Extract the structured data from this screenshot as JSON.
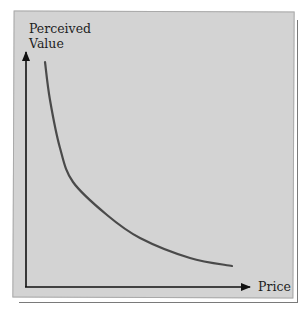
{
  "chart_data": {
    "type": "line",
    "title": "",
    "xlabel": "Price",
    "ylabel": "Perceived Value",
    "ylabel_lines": [
      "Perceived",
      "Value"
    ],
    "grid": false,
    "legend": null,
    "x_ticks": [],
    "y_ticks": [],
    "series": [
      {
        "name": "Perceived value curve",
        "shape": "convex decreasing (inverse relationship)",
        "points_px": [
          [
            45,
            62
          ],
          [
            50,
            100
          ],
          [
            60,
            148
          ],
          [
            73,
            182
          ],
          [
            107,
            215
          ],
          [
            140,
            238
          ],
          [
            190,
            258
          ],
          [
            232,
            266
          ]
        ]
      }
    ],
    "colors": {
      "panel": "#d3d3d3",
      "axis": "#111111",
      "curve": "#4a4a4a"
    }
  }
}
